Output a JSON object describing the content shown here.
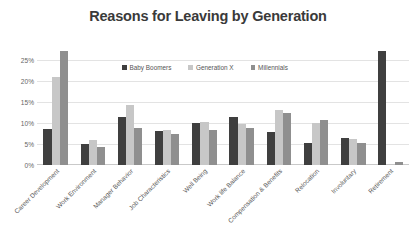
{
  "chart_data": {
    "type": "bar",
    "title": "Reasons for Leaving by Generation",
    "xlabel": "",
    "ylabel": "",
    "ylim": [
      0,
      27.5
    ],
    "grid": true,
    "legend_position": "top-center",
    "ytick_labels": [
      "25%",
      "20%",
      "15%",
      "10%",
      "5%",
      "0%"
    ],
    "ytick_values": [
      25,
      20,
      15,
      10,
      5,
      0
    ],
    "categories": [
      "Career Development",
      "Work Environment",
      "Manager Behavior",
      "Job Characteristics",
      "Well Being",
      "Work life Balance",
      "Compensation & Benefits",
      "Relocation",
      "Involuntary",
      "Retirement"
    ],
    "series": [
      {
        "name": "Baby Boomers",
        "color": "#3f3f3f",
        "values": [
          8.5,
          5.0,
          11.3,
          8.0,
          10.0,
          11.5,
          7.8,
          5.3,
          6.5,
          27.0
        ]
      },
      {
        "name": "Generation X",
        "color": "#c7c7c7",
        "values": [
          20.8,
          6.0,
          14.2,
          8.3,
          10.3,
          9.7,
          13.0,
          10.0,
          6.2,
          0.3
        ]
      },
      {
        "name": "Millennials",
        "color": "#8f8f8f",
        "values": [
          27.0,
          4.3,
          8.7,
          7.3,
          8.3,
          8.8,
          12.3,
          10.7,
          5.3,
          0.6
        ]
      }
    ]
  }
}
